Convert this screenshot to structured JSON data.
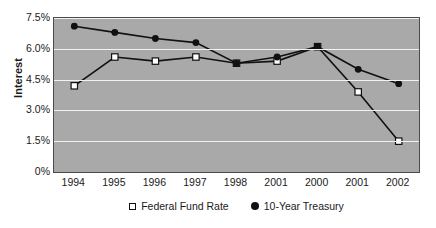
{
  "chart_data": {
    "type": "line",
    "title": "",
    "xlabel": "",
    "ylabel": "Interest",
    "categories": [
      "1994",
      "1995",
      "1996",
      "1997",
      "1998",
      "2001",
      "2000",
      "2001",
      "2002"
    ],
    "ylim": [
      0,
      7.5
    ],
    "ytick_labels": [
      "7.5%",
      "6.0%",
      "4.5%",
      "3.0%",
      "1.5%",
      "0%"
    ],
    "ytick_values": [
      7.5,
      6.0,
      4.5,
      3.0,
      1.5,
      0
    ],
    "grid": true,
    "legend_position": "bottom-center",
    "plot_background": "#a9a9a9",
    "gridline_color": "#f2f2f2",
    "series": [
      {
        "name": "Federal Fund Rate",
        "marker": "open-square",
        "color": "#111111",
        "values": [
          4.2,
          5.6,
          5.4,
          5.6,
          5.3,
          5.4,
          6.1,
          3.9,
          1.5
        ]
      },
      {
        "name": "10-Year Treasury",
        "marker": "filled-circle",
        "color": "#111111",
        "values": [
          7.1,
          6.8,
          6.5,
          6.3,
          5.3,
          5.6,
          6.1,
          5.0,
          4.3
        ]
      }
    ]
  },
  "legend": {
    "items": [
      {
        "label": "Federal Fund Rate",
        "marker": "open-square"
      },
      {
        "label": "10-Year Treasury",
        "marker": "filled-circle"
      }
    ]
  }
}
